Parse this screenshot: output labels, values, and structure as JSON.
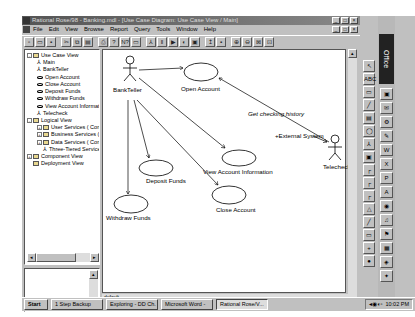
{
  "window": {
    "title": "Rational Rose/98 - Banking.mdl - [Use Case Diagram: Use Case View / Main]",
    "controls": [
      "minimize",
      "maximize",
      "close"
    ]
  },
  "menubar": [
    "File",
    "Edit",
    "View",
    "Browse",
    "Report",
    "Query",
    "Tools",
    "Window",
    "Help"
  ],
  "toolbar": {
    "icons": [
      "new-icon",
      "open-icon",
      "save-icon",
      "cut-icon",
      "copy-icon",
      "paste-icon",
      "print-icon",
      "help-icon",
      "context-help-icon",
      "diagram-icon",
      "class-icon",
      "browse-icon",
      "sequence-icon",
      "component-icon",
      "deployment-icon",
      "parent-icon",
      "previous-icon",
      "zoom-in-icon",
      "zoom-out-icon",
      "fit-icon",
      "undo-fit-icon"
    ]
  },
  "browser": {
    "tree": [
      {
        "level": 0,
        "label": "Use Case View",
        "icon": "folder",
        "expand": "-"
      },
      {
        "level": 1,
        "label": "Main",
        "icon": "diagram"
      },
      {
        "level": 1,
        "label": "BankTeller",
        "icon": "actor"
      },
      {
        "level": 1,
        "label": "Open Account",
        "icon": "usecase"
      },
      {
        "level": 1,
        "label": "Close Account",
        "icon": "usecase"
      },
      {
        "level": 1,
        "label": "Deposit Funds",
        "icon": "usecase"
      },
      {
        "level": 1,
        "label": "Withdraw Funds",
        "icon": "usecase"
      },
      {
        "level": 1,
        "label": "View Account Informat",
        "icon": "usecase"
      },
      {
        "level": 1,
        "label": "Telecheck",
        "icon": "actor"
      },
      {
        "level": 0,
        "label": "Logical View",
        "icon": "folder",
        "expand": "-"
      },
      {
        "level": 1,
        "label": "User Services ( Compo",
        "icon": "folder",
        "expand": "+"
      },
      {
        "level": 1,
        "label": "Business Services ( Co",
        "icon": "folder",
        "expand": "+"
      },
      {
        "level": 1,
        "label": "Data Services ( Compo",
        "icon": "folder",
        "expand": "+"
      },
      {
        "level": 1,
        "label": "Three-Tiered Service M",
        "icon": "actor"
      },
      {
        "level": 0,
        "label": "Component View",
        "icon": "folder",
        "expand": "+"
      },
      {
        "level": 0,
        "label": "Deployment View",
        "icon": "folder"
      }
    ]
  },
  "diagram": {
    "actors": [
      {
        "name": "BankTeller"
      },
      {
        "name": "Telecheck"
      }
    ],
    "use_cases": [
      {
        "name": "Open Account"
      },
      {
        "name": "View Account Information"
      },
      {
        "name": "Deposit Funds"
      },
      {
        "name": "Close Account"
      },
      {
        "name": "Withdraw Funds"
      }
    ],
    "associations": [
      {
        "from": "BankTeller",
        "to": "Open Account"
      },
      {
        "from": "BankTeller",
        "to": "View Account Information"
      },
      {
        "from": "BankTeller",
        "to": "Deposit Funds"
      },
      {
        "from": "BankTeller",
        "to": "Close Account"
      },
      {
        "from": "BankTeller",
        "to": "Withdraw Funds"
      },
      {
        "from": "Telecheck",
        "to": "Open Account",
        "label": "Get checking history"
      }
    ],
    "role_label": "+External System",
    "association_label": "Get checking history"
  },
  "status_tab": "default",
  "palette": [
    "selection-icon",
    "text-icon",
    "note-icon",
    "anchor-icon",
    "package-icon",
    "usecase-icon",
    "actor-icon",
    "class-icon",
    "association-icon",
    "unidirectional-icon",
    "dependency-icon",
    "generalization-icon",
    "realize-icon",
    "state-icon",
    "start-icon",
    "end-icon"
  ],
  "office_bar": {
    "label": "Office"
  },
  "taskbar": {
    "start": "Start",
    "tasks": [
      "1 Step Backup",
      "Exploring - DD Ch.",
      "Microsoft Word -",
      "Rational Rose/V..."
    ],
    "clock": "10:02 PM"
  }
}
